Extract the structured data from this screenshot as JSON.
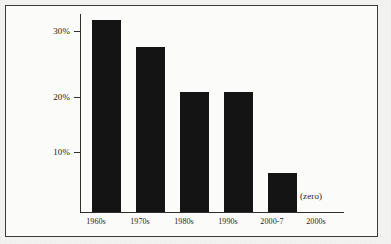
{
  "chart_data": {
    "type": "bar",
    "title": "",
    "subtitle": "",
    "xlabel": "",
    "ylabel": "",
    "categories": [
      "1960s",
      "1970s",
      "1980s",
      "1990s",
      "2000-7",
      "2000s"
    ],
    "values": [
      32,
      27.5,
      20,
      20,
      6.5,
      0
    ],
    "value_unit": "%",
    "ylim": [
      0,
      33
    ],
    "yticks": [
      10,
      20,
      30
    ],
    "ytick_labels": [
      "10%",
      "20%",
      "30%"
    ],
    "grid": false,
    "legend": null,
    "bar_color": "#141414",
    "annotations": [
      {
        "text": "(zero)",
        "category": "2000s",
        "meaning": "the 2000s bar has a value of zero"
      }
    ]
  },
  "figure": {
    "frame_color": "#3a3a3a",
    "background_color": "#f4f4f2",
    "plot_background_color": "#fbfbfa",
    "axis_color": "#2e2e2e"
  }
}
